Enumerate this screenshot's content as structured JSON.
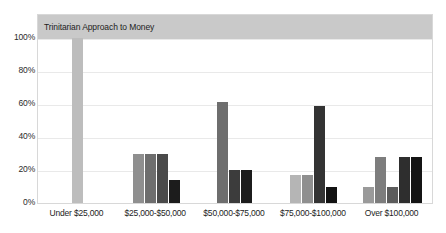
{
  "chart_data": {
    "type": "bar",
    "title": "Trinitarian Approach to Money",
    "xlabel": "",
    "ylabel": "",
    "ylim": [
      0,
      100
    ],
    "ytick_labels": [
      "100%",
      "80%",
      "60%",
      "40%",
      "20%",
      "0%"
    ],
    "ytick_values": [
      100,
      80,
      60,
      40,
      20,
      0
    ],
    "grid": true,
    "legend": "none",
    "categories": [
      "Under $25,000",
      "$25,000-$50,000",
      "$50,000-$75,000",
      "$75,000-$100,000",
      "Over $100,000"
    ],
    "groups": [
      {
        "category": "Under $25,000",
        "bars": [
          {
            "value": 100,
            "color": "#bdbdbd"
          }
        ]
      },
      {
        "category": "$25,000-$50,000",
        "bars": [
          {
            "value": 30,
            "color": "#8f8f8f"
          },
          {
            "value": 30,
            "color": "#6e6e6e"
          },
          {
            "value": 30,
            "color": "#4a4a4a"
          },
          {
            "value": 14,
            "color": "#1c1c1c"
          }
        ]
      },
      {
        "category": "$50,000-$75,000",
        "bars": [
          {
            "value": 61,
            "color": "#6e6e6e"
          },
          {
            "value": 20,
            "color": "#3c3c3c"
          },
          {
            "value": 20,
            "color": "#1c1c1c"
          }
        ]
      },
      {
        "category": "$75,000-$100,000",
        "bars": [
          {
            "value": 17,
            "color": "#b5b5b5"
          },
          {
            "value": 17,
            "color": "#8f8f8f"
          },
          {
            "value": 59,
            "color": "#333333"
          },
          {
            "value": 10,
            "color": "#121212"
          }
        ]
      },
      {
        "category": "Over $100,000",
        "bars": [
          {
            "value": 10,
            "color": "#9a9a9a"
          },
          {
            "value": 28,
            "color": "#7d7d7d"
          },
          {
            "value": 10,
            "color": "#5c5c5c"
          },
          {
            "value": 28,
            "color": "#2e2e2e"
          },
          {
            "value": 28,
            "color": "#141414"
          }
        ]
      }
    ],
    "colors": {
      "title_banner_bg": "#c9c9c9",
      "plot_bg": "#ffffff",
      "plot_border": "#d8d8d8",
      "gridline": "#e9e9e9",
      "baseline": "#d0d0d0",
      "text": "#1d1d1d"
    }
  }
}
